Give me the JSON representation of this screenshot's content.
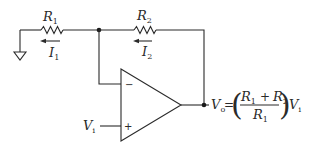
{
  "diagram": {
    "type": "non-inverting-op-amp-circuit",
    "components": {
      "r1": {
        "symbol": "R",
        "subscript": "1"
      },
      "r2": {
        "symbol": "R",
        "subscript": "2"
      },
      "opamp": {
        "inverting_input": "−",
        "noninverting_input": "+"
      },
      "ground": {
        "symbol": "ground"
      }
    },
    "currents": {
      "i1": {
        "symbol": "I",
        "subscript": "1",
        "direction": "left"
      },
      "i2": {
        "symbol": "I",
        "subscript": "2",
        "direction": "left"
      }
    },
    "input": {
      "symbol": "V",
      "subscript": "i"
    },
    "output": {
      "symbol": "V",
      "subscript": "o"
    },
    "formula": {
      "lhs_symbol": "V",
      "lhs_subscript": "o",
      "equals": "=",
      "numerator_a_symbol": "R",
      "numerator_a_subscript": "1",
      "plus": "+",
      "numerator_b_symbol": "R",
      "numerator_b_subscript": "2",
      "denominator_symbol": "R",
      "denominator_subscript": "1",
      "left_paren": "(",
      "right_paren": ")",
      "rhs_symbol": "V",
      "rhs_subscript": "i"
    },
    "colors": {
      "ink": "#2a2a2a",
      "background": "#ffffff"
    }
  }
}
